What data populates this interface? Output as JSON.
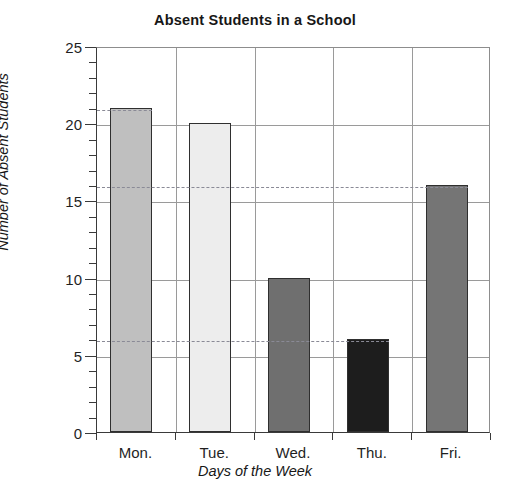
{
  "chart_data": {
    "type": "bar",
    "title": "Absent Students in a School",
    "xlabel": "Days of the Week",
    "ylabel": "Number of Absent Students",
    "categories": [
      "Mon.",
      "Tue.",
      "Wed.",
      "Thu.",
      "Fri."
    ],
    "values": [
      21,
      20,
      10,
      6,
      16
    ],
    "ylim": [
      0,
      25
    ],
    "y_major_ticks": [
      0,
      5,
      10,
      15,
      20,
      25
    ],
    "y_tick_labels": [
      "0",
      "5",
      "10",
      "15",
      "20",
      "25"
    ],
    "y_minor_tick_step": 1,
    "grid": "horizontal-and-vertical",
    "legend": "none",
    "bar_colors": [
      "#bfbfbf",
      "#ededed",
      "#6f6f6f",
      "#1d1d1d",
      "#757575"
    ],
    "bar_edge_color": "#2f2f2f",
    "annotation_dashed_levels": [
      21,
      16,
      6
    ],
    "dashed_line_color": "#8a8a96",
    "axis_color": "#3a3a3a",
    "gridline_color": "#9a9a9a"
  }
}
